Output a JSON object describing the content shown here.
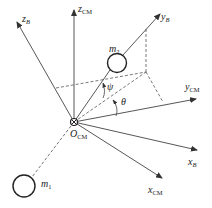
{
  "diagram": {
    "origin": {
      "label": "O",
      "sub": "CM",
      "x": 74,
      "y": 122
    },
    "axes": [
      {
        "id": "z_CM",
        "label": "z",
        "sub": "CM",
        "sub_italic": false,
        "to": [
          74,
          10
        ],
        "label_pos": [
          78,
          4
        ]
      },
      {
        "id": "z_B",
        "label": "z",
        "sub": "B",
        "sub_italic": true,
        "to": [
          17,
          22
        ],
        "label_pos": [
          22,
          14
        ]
      },
      {
        "id": "y_B",
        "label": "y",
        "sub": "B",
        "sub_italic": true,
        "to": [
          160,
          14
        ],
        "label_pos": [
          161,
          12
        ]
      },
      {
        "id": "y_CM",
        "label": "y",
        "sub": "CM",
        "sub_italic": false,
        "to": [
          196,
          99
        ],
        "label_pos": [
          185,
          82
        ]
      },
      {
        "id": "x_B",
        "label": "x",
        "sub": "B",
        "sub_italic": true,
        "to": [
          197,
          150
        ],
        "label_pos": [
          188,
          157
        ]
      },
      {
        "id": "x_CM",
        "label": "x",
        "sub": "CM",
        "sub_italic": false,
        "to": [
          162,
          178
        ],
        "label_pos": [
          148,
          185
        ]
      }
    ],
    "masses": [
      {
        "id": "m1",
        "label": "m",
        "sub": "1",
        "cx": 24,
        "cy": 186,
        "r": 11,
        "label_pos": [
          41,
          179
        ]
      },
      {
        "id": "m2",
        "label": "m",
        "sub": "2",
        "cx": 117,
        "cy": 63,
        "r": 9.5,
        "label_pos": [
          109,
          44
        ]
      }
    ],
    "angles": [
      {
        "id": "psi",
        "label": "ψ",
        "label_pos": [
          107,
          82
        ]
      },
      {
        "id": "theta",
        "label": "θ",
        "label_pos": [
          121,
          97
        ]
      }
    ],
    "colors": {
      "line": "#444444",
      "dash": "#555555",
      "text": "#222222",
      "background": "#ffffff"
    }
  }
}
